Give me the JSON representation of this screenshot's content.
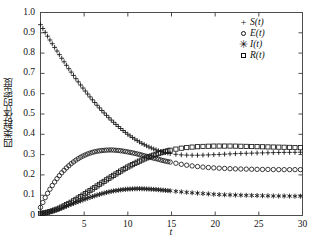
{
  "chart_data": {
    "type": "line",
    "title": "",
    "xlabel": "t",
    "ylabel": "四类群体的密度",
    "xlim": [
      0,
      30
    ],
    "ylim": [
      0,
      1.0
    ],
    "grid": false,
    "legend_position": "top-right",
    "xticks": [
      "5",
      "10",
      "15",
      "20",
      "25",
      "30"
    ],
    "xtick_values": [
      5,
      10,
      15,
      20,
      25,
      30
    ],
    "yticks": [
      "0",
      "0.1",
      "0.2",
      "0.3",
      "0.4",
      "0.5",
      "0.6",
      "0.7",
      "0.8",
      "0.9",
      "1.0"
    ],
    "ytick_values": [
      0,
      0.1,
      0.2,
      0.3,
      0.4,
      0.5,
      0.6,
      0.7,
      0.8,
      0.9,
      1.0
    ],
    "x": [
      0,
      0.5,
      1,
      1.5,
      2,
      2.5,
      3,
      3.5,
      4,
      4.5,
      5,
      5.5,
      6,
      6.5,
      7,
      7.5,
      8,
      8.5,
      9,
      9.5,
      10,
      10.5,
      11,
      11.5,
      12,
      12.5,
      13,
      13.5,
      14,
      14.5,
      15,
      16,
      17,
      18,
      19,
      20,
      21,
      22,
      23,
      24,
      25,
      26,
      27,
      28,
      29,
      30
    ],
    "series": [
      {
        "name": "S(t)",
        "marker": "plus",
        "values": [
          0.94,
          0.905,
          0.87,
          0.836,
          0.803,
          0.77,
          0.738,
          0.707,
          0.677,
          0.648,
          0.62,
          0.593,
          0.567,
          0.542,
          0.518,
          0.496,
          0.474,
          0.454,
          0.435,
          0.417,
          0.4,
          0.385,
          0.371,
          0.358,
          0.346,
          0.336,
          0.327,
          0.319,
          0.313,
          0.308,
          0.304,
          0.299,
          0.297,
          0.297,
          0.298,
          0.3,
          0.302,
          0.304,
          0.306,
          0.307,
          0.308,
          0.309,
          0.31,
          0.311,
          0.311,
          0.312
        ]
      },
      {
        "name": "E(t)",
        "marker": "circle",
        "values": [
          0.04,
          0.085,
          0.124,
          0.158,
          0.188,
          0.214,
          0.236,
          0.255,
          0.271,
          0.285,
          0.296,
          0.305,
          0.312,
          0.317,
          0.32,
          0.322,
          0.323,
          0.322,
          0.32,
          0.317,
          0.313,
          0.309,
          0.304,
          0.299,
          0.293,
          0.288,
          0.282,
          0.277,
          0.271,
          0.266,
          0.262,
          0.253,
          0.246,
          0.241,
          0.237,
          0.234,
          0.232,
          0.23,
          0.229,
          0.228,
          0.227,
          0.227,
          0.226,
          0.226,
          0.226,
          0.226
        ]
      },
      {
        "name": "I(t)",
        "marker": "star",
        "values": [
          0.01,
          0.013,
          0.018,
          0.024,
          0.031,
          0.039,
          0.047,
          0.055,
          0.063,
          0.071,
          0.079,
          0.087,
          0.094,
          0.101,
          0.107,
          0.113,
          0.118,
          0.122,
          0.125,
          0.128,
          0.13,
          0.131,
          0.132,
          0.132,
          0.131,
          0.13,
          0.129,
          0.127,
          0.125,
          0.123,
          0.121,
          0.117,
          0.113,
          0.11,
          0.107,
          0.104,
          0.102,
          0.101,
          0.1,
          0.099,
          0.098,
          0.097,
          0.096,
          0.096,
          0.095,
          0.095
        ]
      },
      {
        "name": "R(t)",
        "marker": "square",
        "values": [
          0.01,
          0.013,
          0.018,
          0.025,
          0.033,
          0.043,
          0.054,
          0.065,
          0.078,
          0.091,
          0.104,
          0.118,
          0.132,
          0.146,
          0.16,
          0.174,
          0.188,
          0.201,
          0.214,
          0.227,
          0.239,
          0.25,
          0.261,
          0.271,
          0.281,
          0.29,
          0.298,
          0.305,
          0.312,
          0.318,
          0.323,
          0.331,
          0.336,
          0.339,
          0.341,
          0.342,
          0.342,
          0.342,
          0.341,
          0.34,
          0.339,
          0.338,
          0.337,
          0.336,
          0.335,
          0.334
        ]
      }
    ],
    "legend": [
      {
        "marker": "plus",
        "label": "S(t)"
      },
      {
        "marker": "circle",
        "label": "E(t)"
      },
      {
        "marker": "star",
        "label": "I(t)"
      },
      {
        "marker": "square",
        "label": "R(t)"
      }
    ]
  }
}
